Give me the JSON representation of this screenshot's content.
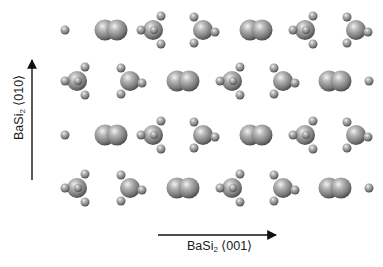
{
  "figure": {
    "background": "#ffffff",
    "atom_color": "#8a8a8a",
    "arrow_color": "#111111",
    "y_axis": {
      "base": "BaSi",
      "sub": "2",
      "direction": "⟨010⟩"
    },
    "x_axis": {
      "base": "BaSi",
      "sub": "2",
      "direction": "⟨001⟩"
    }
  },
  "rows": [
    {
      "y": 30,
      "motifs": [
        {
          "type": "atom",
          "x": 65
        },
        {
          "type": "dimer",
          "x": 111
        },
        {
          "type": "tetra-front",
          "x": 153
        },
        {
          "type": "tetra-side",
          "x": 203
        },
        {
          "type": "dimer",
          "x": 256
        },
        {
          "type": "tetra-front",
          "x": 305
        },
        {
          "type": "tetra-side",
          "x": 356
        }
      ]
    },
    {
      "y": 81,
      "motifs": [
        {
          "type": "tetra-front",
          "x": 77
        },
        {
          "type": "tetra-side",
          "x": 130
        },
        {
          "type": "dimer",
          "x": 183
        },
        {
          "type": "tetra-front",
          "x": 232
        },
        {
          "type": "tetra-side",
          "x": 283
        },
        {
          "type": "dimer",
          "x": 335
        },
        {
          "type": "atom",
          "x": 369
        }
      ]
    },
    {
      "y": 135,
      "motifs": [
        {
          "type": "atom",
          "x": 65
        },
        {
          "type": "dimer",
          "x": 111
        },
        {
          "type": "tetra-front",
          "x": 153
        },
        {
          "type": "tetra-side",
          "x": 203
        },
        {
          "type": "dimer",
          "x": 256
        },
        {
          "type": "tetra-front",
          "x": 305
        },
        {
          "type": "tetra-side",
          "x": 356
        }
      ]
    },
    {
      "y": 188,
      "motifs": [
        {
          "type": "tetra-front",
          "x": 77
        },
        {
          "type": "tetra-side",
          "x": 130
        },
        {
          "type": "dimer",
          "x": 183
        },
        {
          "type": "tetra-front",
          "x": 232
        },
        {
          "type": "tetra-side",
          "x": 283
        },
        {
          "type": "dimer",
          "x": 335
        },
        {
          "type": "atom",
          "x": 369
        }
      ]
    }
  ]
}
